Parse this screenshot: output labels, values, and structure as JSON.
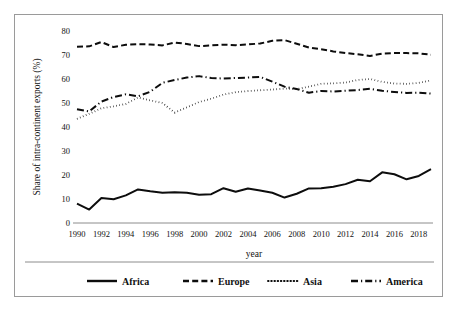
{
  "figure": {
    "border_color": "#9a9a9a",
    "background": "#ffffff",
    "ink_color": "#0d0d0d"
  },
  "axes": {
    "y_title": "Share of intra-continent exports (%)",
    "x_title": "year",
    "y_ticks": [
      "0",
      "10",
      "20",
      "30",
      "40",
      "50",
      "60",
      "70",
      "80"
    ],
    "x_ticks": [
      "1990",
      "1992",
      "1994",
      "1996",
      "1998",
      "2000",
      "2002",
      "2004",
      "2006",
      "2008",
      "2010",
      "2012",
      "2014",
      "2016",
      "2018"
    ]
  },
  "legend": {
    "items": [
      {
        "label": "Africa",
        "dash": "none"
      },
      {
        "label": "Europe",
        "dash": "dashed"
      },
      {
        "label": "Asia",
        "dash": "dotted"
      },
      {
        "label": "America",
        "dash": "dashdot"
      }
    ]
  },
  "chart_data": {
    "type": "line",
    "title": "",
    "xlabel": "year",
    "ylabel": "Share of intra-continent exports (%)",
    "xlim": [
      1990,
      2019
    ],
    "ylim": [
      0,
      80
    ],
    "grid": false,
    "legend_position": "bottom",
    "x": [
      1990,
      1991,
      1992,
      1993,
      1994,
      1995,
      1996,
      1997,
      1998,
      1999,
      2000,
      2001,
      2002,
      2003,
      2004,
      2005,
      2006,
      2007,
      2008,
      2009,
      2010,
      2011,
      2012,
      2013,
      2014,
      2015,
      2016,
      2017,
      2018,
      2019
    ],
    "series": [
      {
        "name": "Africa",
        "dash": "none",
        "values": [
          8.1,
          5.6,
          10.4,
          9.9,
          11.5,
          14.0,
          13.2,
          12.6,
          12.8,
          12.6,
          11.8,
          12.0,
          14.5,
          13.0,
          14.4,
          13.5,
          12.6,
          10.6,
          12.2,
          14.4,
          14.5,
          15.1,
          16.2,
          18.0,
          17.4,
          21.1,
          20.3,
          18.2,
          19.6,
          22.4
        ]
      },
      {
        "name": "Europe",
        "dash": "dashed",
        "values": [
          73.4,
          73.6,
          75.4,
          73.3,
          74.3,
          74.5,
          74.4,
          74.0,
          75.2,
          74.6,
          73.7,
          74.0,
          74.3,
          74.1,
          74.4,
          74.8,
          75.9,
          76.2,
          74.7,
          73.1,
          72.4,
          71.5,
          70.8,
          70.3,
          69.6,
          70.6,
          70.8,
          70.8,
          70.7,
          70.1
        ]
      },
      {
        "name": "Asia",
        "dash": "dotted",
        "values": [
          43.4,
          45.5,
          47.8,
          48.6,
          49.6,
          52.3,
          51.1,
          50.0,
          46.0,
          48.2,
          50.4,
          51.8,
          53.5,
          54.5,
          55.0,
          55.3,
          55.6,
          56.0,
          55.8,
          56.8,
          58.0,
          58.2,
          58.5,
          59.6,
          60.0,
          58.8,
          58.1,
          58.0,
          58.4,
          59.4
        ]
      },
      {
        "name": "America",
        "dash": "dashdot",
        "values": [
          47.4,
          46.5,
          50.6,
          52.5,
          53.6,
          52.8,
          54.7,
          58.4,
          59.6,
          60.6,
          61.2,
          60.4,
          60.2,
          60.4,
          60.6,
          60.9,
          58.9,
          56.8,
          55.8,
          54.3,
          55.0,
          54.8,
          55.1,
          55.4,
          55.9,
          55.1,
          54.6,
          54.2,
          54.3,
          53.9
        ]
      }
    ]
  }
}
